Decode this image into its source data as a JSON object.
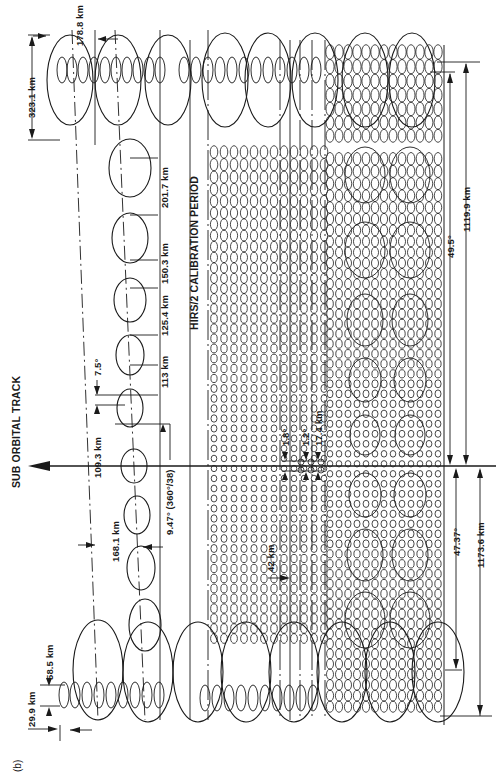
{
  "figure": {
    "panel_label": "(b)",
    "title": "SUB ORBITAL TRACK",
    "calibration_label": "HIRS/2 CALIBRATION PERIOD",
    "colors": {
      "ink": "#1a1a1a",
      "background": "#ffffff"
    }
  },
  "dimensions": {
    "top_scan_width": "323.1 km",
    "top_small_spacing": "178.8 km",
    "footprint_201": "201.7 km",
    "footprint_150": "150.3 km",
    "footprint_125": "125.4 km",
    "footprint_113": "113 km",
    "angle_7_5": "7.5°",
    "footprint_109": "109.3 km",
    "angle_9_47": "9.47° (360°/38)",
    "footprint_168": "168.1 km",
    "bottom_large": "58.5 km",
    "bottom_small": "29.9 km",
    "spacing_42": "42 km",
    "angle_1_8": "1.8°",
    "angle_1_2": "1.2°",
    "footprint_17_4": "17.4 km",
    "angle_49_5": "49.5°",
    "swath_1119": "1119.9 km",
    "angle_47_37": "47.37°",
    "swath_1173": "1173.6 km"
  }
}
